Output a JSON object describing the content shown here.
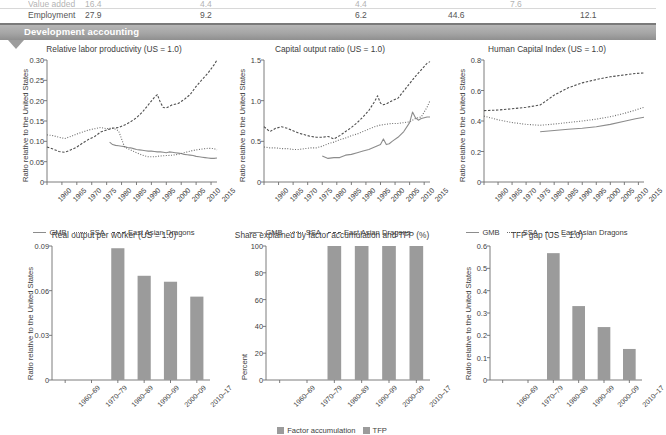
{
  "table_fragment": {
    "rows": [
      {
        "label": "Value added",
        "values": [
          "16.4",
          "4.4",
          "4.4",
          "7.6",
          "8.5"
        ]
      },
      {
        "label": "Employment",
        "values": [
          "27.9",
          "9.2",
          "6.2",
          "44.6",
          "12.1"
        ]
      }
    ],
    "col_x": [
      28,
      85,
      200,
      355,
      510
    ]
  },
  "section_banner": {
    "title": "Development accounting"
  },
  "axis_labels": {
    "ratio_us": "Ratio relative to the United States",
    "percent": "Percent"
  },
  "legend_lines": [
    {
      "name": "GMB",
      "style": "solid"
    },
    {
      "name": "SSA",
      "style": "dotted"
    },
    {
      "name": "East Asian Dragons",
      "style": "dashed"
    }
  ],
  "legend_bars": [
    {
      "name": "Factor accumulation",
      "color": "#9b9b9b"
    },
    {
      "name": "TFP",
      "color": "#9b9b9b"
    }
  ],
  "colors": {
    "banner": "#a5a5a5",
    "bar": "#9b9b9b",
    "gmb": "#8c8c8c",
    "ssa": "#6f6f6f",
    "dragons": "#4f4f4f",
    "axis": "#6e6e6e"
  },
  "chart_data": [
    {
      "id": "relative-labor-productivity",
      "type": "line",
      "title": "Relative labor productivity (US = 1.0)",
      "xlabel": "",
      "ylabel": "Ratio relative to the United States",
      "xlim": [
        1960,
        2017
      ],
      "ylim": [
        0,
        0.3
      ],
      "yticks": [
        0,
        0.05,
        0.1,
        0.15,
        0.2,
        0.25,
        0.3
      ],
      "ytick_labels": [
        "0",
        "0.05",
        "0.10",
        "0.15",
        "0.20",
        "0.25",
        "0.30"
      ],
      "xticks": [
        1960,
        1965,
        1970,
        1975,
        1980,
        1985,
        1990,
        1995,
        2000,
        2005,
        2010,
        2015
      ],
      "grid": false,
      "legend_position": "bottom",
      "series": [
        {
          "name": "GMB",
          "style": "solid",
          "x": [
            1981,
            1982,
            1983,
            1984,
            1985,
            1986,
            1987,
            1988,
            1989,
            1990,
            1991,
            1992,
            1993,
            1994,
            1995,
            1996,
            1997,
            1998,
            1999,
            2000,
            2001,
            2002,
            2003,
            2004,
            2005,
            2006,
            2007,
            2008,
            2009,
            2010,
            2011,
            2012,
            2013,
            2014,
            2015,
            2016,
            2017
          ],
          "values": [
            0.098,
            0.092,
            0.09,
            0.089,
            0.088,
            0.087,
            0.085,
            0.084,
            0.082,
            0.08,
            0.079,
            0.078,
            0.077,
            0.076,
            0.076,
            0.075,
            0.074,
            0.074,
            0.073,
            0.072,
            0.074,
            0.073,
            0.072,
            0.071,
            0.07,
            0.068,
            0.067,
            0.066,
            0.065,
            0.063,
            0.062,
            0.061,
            0.06,
            0.059,
            0.058,
            0.058,
            0.059
          ]
        },
        {
          "name": "SSA",
          "style": "dotted",
          "x": [
            1960,
            1962,
            1964,
            1966,
            1968,
            1970,
            1972,
            1974,
            1976,
            1978,
            1980,
            1982,
            1984,
            1986,
            1988,
            1990,
            1992,
            1994,
            1996,
            1998,
            2000,
            2002,
            2004,
            2006,
            2008,
            2010,
            2012,
            2014,
            2016,
            2017
          ],
          "values": [
            0.116,
            0.114,
            0.11,
            0.107,
            0.112,
            0.118,
            0.123,
            0.128,
            0.131,
            0.134,
            0.131,
            0.133,
            0.126,
            0.086,
            0.079,
            0.072,
            0.066,
            0.062,
            0.062,
            0.064,
            0.065,
            0.066,
            0.068,
            0.072,
            0.076,
            0.079,
            0.081,
            0.083,
            0.082,
            0.079
          ]
        },
        {
          "name": "East Asian Dragons",
          "style": "dashed",
          "x": [
            1960,
            1962,
            1964,
            1966,
            1968,
            1970,
            1972,
            1974,
            1976,
            1978,
            1980,
            1982,
            1984,
            1986,
            1988,
            1990,
            1992,
            1994,
            1996,
            1997,
            1998,
            1999,
            2000,
            2002,
            2004,
            2006,
            2008,
            2010,
            2012,
            2014,
            2016,
            2017
          ],
          "values": [
            0.086,
            0.081,
            0.075,
            0.073,
            0.079,
            0.086,
            0.096,
            0.105,
            0.112,
            0.123,
            0.128,
            0.132,
            0.134,
            0.14,
            0.148,
            0.158,
            0.172,
            0.19,
            0.208,
            0.215,
            0.196,
            0.183,
            0.182,
            0.19,
            0.193,
            0.203,
            0.215,
            0.235,
            0.252,
            0.268,
            0.288,
            0.3
          ]
        }
      ]
    },
    {
      "id": "capital-output-ratio",
      "type": "line",
      "title": "Capital output ratio (US = 1.0)",
      "xlabel": "",
      "ylabel": "Ratio relative to the United States",
      "xlim": [
        1960,
        2017
      ],
      "ylim": [
        0,
        1.5
      ],
      "yticks": [
        0,
        0.5,
        1.0,
        1.5
      ],
      "ytick_labels": [
        "0",
        "0.5",
        "1.0",
        "1.5"
      ],
      "xticks": [
        1960,
        1965,
        1970,
        1975,
        1980,
        1985,
        1990,
        1995,
        2000,
        2005,
        2010,
        2015
      ],
      "grid": false,
      "legend_position": "bottom",
      "series": [
        {
          "name": "GMB",
          "style": "solid",
          "x": [
            1980,
            1982,
            1984,
            1986,
            1988,
            1990,
            1992,
            1994,
            1996,
            1998,
            2000,
            2001,
            2002,
            2003,
            2004,
            2006,
            2008,
            2010,
            2011,
            2012,
            2013,
            2014,
            2016,
            2017
          ],
          "values": [
            0.32,
            0.29,
            0.3,
            0.3,
            0.33,
            0.34,
            0.36,
            0.38,
            0.4,
            0.43,
            0.46,
            0.53,
            0.46,
            0.47,
            0.5,
            0.55,
            0.62,
            0.73,
            0.86,
            0.79,
            0.76,
            0.78,
            0.8,
            0.8
          ]
        },
        {
          "name": "SSA",
          "style": "dotted",
          "x": [
            1960,
            1962,
            1964,
            1966,
            1968,
            1970,
            1972,
            1974,
            1976,
            1978,
            1980,
            1982,
            1984,
            1986,
            1988,
            1990,
            1992,
            1994,
            1996,
            1998,
            2000,
            2002,
            2004,
            2006,
            2008,
            2010,
            2012,
            2014,
            2016,
            2017
          ],
          "values": [
            0.43,
            0.42,
            0.42,
            0.41,
            0.41,
            0.4,
            0.4,
            0.41,
            0.42,
            0.42,
            0.44,
            0.47,
            0.49,
            0.52,
            0.54,
            0.57,
            0.59,
            0.62,
            0.65,
            0.68,
            0.7,
            0.71,
            0.72,
            0.72,
            0.73,
            0.74,
            0.78,
            0.8,
            0.92,
            1.0
          ]
        },
        {
          "name": "East Asian Dragons",
          "style": "dashed",
          "x": [
            1960,
            1962,
            1964,
            1966,
            1968,
            1970,
            1972,
            1974,
            1976,
            1978,
            1980,
            1982,
            1984,
            1986,
            1988,
            1990,
            1992,
            1994,
            1996,
            1998,
            1999,
            2000,
            2001,
            2002,
            2004,
            2006,
            2008,
            2010,
            2012,
            2014,
            2016,
            2017
          ],
          "values": [
            0.68,
            0.62,
            0.66,
            0.68,
            0.66,
            0.63,
            0.6,
            0.58,
            0.56,
            0.55,
            0.55,
            0.56,
            0.53,
            0.57,
            0.62,
            0.67,
            0.73,
            0.8,
            0.88,
            0.99,
            1.06,
            0.97,
            0.95,
            0.96,
            1.0,
            1.03,
            1.12,
            1.21,
            1.3,
            1.38,
            1.46,
            1.48
          ]
        }
      ]
    },
    {
      "id": "human-capital-index",
      "type": "line",
      "title": "Human Capital Index (US = 1.0)",
      "xlabel": "",
      "ylabel": "Ratio relative to the United States",
      "xlim": [
        1960,
        2017
      ],
      "ylim": [
        0,
        0.8
      ],
      "yticks": [
        0,
        0.2,
        0.4,
        0.6,
        0.8
      ],
      "ytick_labels": [
        "0",
        "0.2",
        "0.4",
        "0.6",
        "0.8"
      ],
      "xticks": [
        1960,
        1965,
        1970,
        1975,
        1980,
        1985,
        1990,
        1995,
        2000,
        2005,
        2010,
        2015
      ],
      "grid": false,
      "legend_position": "bottom",
      "series": [
        {
          "name": "GMB",
          "style": "solid",
          "x": [
            1980,
            1985,
            1990,
            1995,
            2000,
            2005,
            2010,
            2014,
            2017
          ],
          "values": [
            0.33,
            0.338,
            0.346,
            0.352,
            0.362,
            0.378,
            0.398,
            0.415,
            0.425
          ]
        },
        {
          "name": "SSA",
          "style": "dotted",
          "x": [
            1960,
            1965,
            1970,
            1975,
            1980,
            1985,
            1990,
            1995,
            2000,
            2005,
            2010,
            2014,
            2017
          ],
          "values": [
            0.432,
            0.408,
            0.39,
            0.378,
            0.372,
            0.38,
            0.39,
            0.4,
            0.412,
            0.428,
            0.45,
            0.472,
            0.49
          ]
        },
        {
          "name": "East Asian Dragons",
          "style": "dashed",
          "x": [
            1960,
            1965,
            1970,
            1975,
            1980,
            1982,
            1985,
            1990,
            1995,
            2000,
            2005,
            2010,
            2014,
            2017
          ],
          "values": [
            0.468,
            0.472,
            0.48,
            0.49,
            0.505,
            0.53,
            0.57,
            0.618,
            0.65,
            0.672,
            0.69,
            0.702,
            0.712,
            0.715
          ]
        }
      ]
    },
    {
      "id": "real-output-per-worker",
      "type": "bar",
      "title": "Real output per worker (US = 1.0)",
      "xlabel": "",
      "ylabel": "Ratio relative to the United States",
      "ylim": [
        0,
        0.09
      ],
      "yticks": [
        0,
        0.03,
        0.06,
        0.09
      ],
      "ytick_labels": [
        "0",
        "0.03",
        "0.06",
        "0.09"
      ],
      "categories": [
        "1960–69",
        "1970–79",
        "1980–89",
        "1990–99",
        "2000–09",
        "2010–17"
      ],
      "values": [
        null,
        null,
        0.0885,
        0.07,
        0.066,
        0.056
      ],
      "grid": false,
      "legend_position": "none"
    },
    {
      "id": "share-explained-factor-tfp",
      "type": "bar",
      "title": "Share explained by factor accumulation and TFP (%)",
      "xlabel": "",
      "ylabel": "Percent",
      "ylim": [
        0,
        100
      ],
      "yticks": [
        0,
        20,
        40,
        60,
        80,
        100
      ],
      "ytick_labels": [
        "0",
        "20",
        "40",
        "60",
        "80",
        "100"
      ],
      "categories": [
        "1960–69",
        "1970–79",
        "1980–89",
        "1990–99",
        "2000–09",
        "2010–17"
      ],
      "series": [
        {
          "name": "Factor accumulation",
          "values": [
            null,
            null,
            100,
            100,
            100,
            100
          ]
        },
        {
          "name": "TFP",
          "values": [
            null,
            null,
            0,
            0,
            0,
            0
          ]
        }
      ],
      "grid": false,
      "legend_position": "bottom"
    },
    {
      "id": "tfp-gap",
      "type": "bar",
      "title": "TFP gap (US = 1.0)",
      "xlabel": "",
      "ylabel": "Ratio relative to the United States",
      "ylim": [
        0,
        0.6
      ],
      "yticks": [
        0,
        0.1,
        0.2,
        0.3,
        0.4,
        0.5,
        0.6
      ],
      "ytick_labels": [
        "0",
        "0.1",
        "0.2",
        "0.3",
        "0.4",
        "0.5",
        "0.6"
      ],
      "categories": [
        "1960–69",
        "1970–79",
        "1980–89",
        "1990–99",
        "2000–09",
        "2010–17"
      ],
      "values": [
        null,
        null,
        0.568,
        0.331,
        0.237,
        0.139
      ],
      "grid": false,
      "legend_position": "none"
    }
  ]
}
